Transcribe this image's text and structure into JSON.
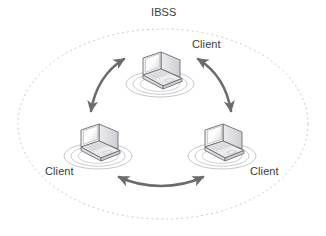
{
  "diagram": {
    "title": "IBSS",
    "type": "wireless-ad-hoc-network-topology",
    "background_color": "#ffffff",
    "boundary": {
      "shape": "dashed-ellipse",
      "color": "#c9c9cf",
      "dash": "2 3"
    },
    "arrow_color": "#6b6b6b",
    "device_line_color": "#555555",
    "ripple_color": "#9a9a9a",
    "nodes": [
      {
        "id": "top",
        "label": "Client",
        "device": "laptop-icon",
        "cx": 160,
        "cy": 78
      },
      {
        "id": "left",
        "label": "Client",
        "device": "laptop-icon",
        "cx": 98,
        "cy": 150
      },
      {
        "id": "right",
        "label": "Client",
        "device": "laptop-icon",
        "cx": 222,
        "cy": 150
      }
    ],
    "links": [
      {
        "id": "top-left",
        "from": "top",
        "to": "left",
        "style": "double-headed-curved-arrow"
      },
      {
        "id": "top-right",
        "from": "top",
        "to": "right",
        "style": "double-headed-curved-arrow"
      },
      {
        "id": "left-right",
        "from": "left",
        "to": "right",
        "style": "double-headed-curved-arrow"
      }
    ]
  }
}
